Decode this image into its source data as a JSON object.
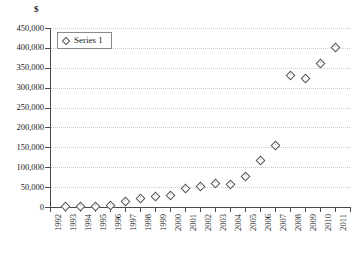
{
  "chart_data": {
    "type": "scatter",
    "title": "",
    "subtitle": "",
    "xlabel": "",
    "ylabel": "$",
    "unit_label": "$",
    "grid": true,
    "legend_position": "top-left",
    "xlim": [
      1992,
      2012
    ],
    "ylim": [
      0,
      450000
    ],
    "ytick_step": 50000,
    "categories": [
      "1992",
      "1993",
      "1994",
      "1995",
      "1996",
      "1997",
      "1998",
      "1999",
      "2000",
      "2001",
      "2002",
      "2003",
      "2004",
      "2005",
      "2006",
      "2007",
      "2008",
      "2009",
      "2010",
      "2011",
      "2012"
    ],
    "ytick_labels": [
      "450,000",
      "400,000",
      "350,000",
      "300,000",
      "250,000",
      "200,000",
      "150,000",
      "100,000",
      "50,000",
      "0"
    ],
    "ytick_values": [
      450000,
      400000,
      350000,
      300000,
      250000,
      200000,
      150000,
      100000,
      50000,
      0
    ],
    "series": [
      {
        "name": "Series 1",
        "marker": "open-diamond",
        "color": "#555555",
        "x": [
          1993,
          1994,
          1995,
          1996,
          1997,
          1998,
          1999,
          2000,
          2001,
          2002,
          2003,
          2004,
          2005,
          2006,
          2007,
          2008,
          2009,
          2010,
          2011
        ],
        "values": [
          1500,
          1800,
          2000,
          5000,
          15000,
          23000,
          28000,
          30000,
          48000,
          52000,
          60000,
          58000,
          78000,
          118000,
          157000,
          332000,
          325000,
          363000,
          403000
        ]
      }
    ],
    "legend": [
      {
        "label": "Series 1",
        "marker": "open-diamond"
      }
    ]
  },
  "caption": {
    "text": ""
  }
}
